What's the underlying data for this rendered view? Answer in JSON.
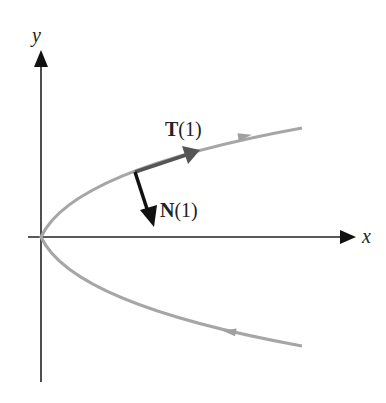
{
  "figure": {
    "axes": {
      "x_label": "x",
      "y_label": "y"
    },
    "vectors": {
      "tangent": {
        "name": "T",
        "arg": "(1)"
      },
      "normal": {
        "name": "N",
        "arg": "(1)"
      }
    },
    "colors": {
      "axes": "#111111",
      "curve": "#a6a6a6",
      "tangent": "#555555",
      "normal": "#111111"
    }
  }
}
